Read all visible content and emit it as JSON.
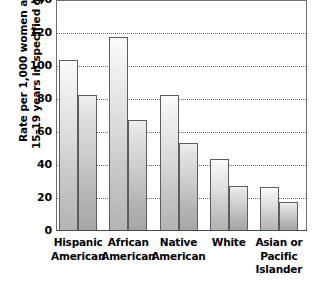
{
  "chart_data": {
    "type": "bar",
    "title": "",
    "subtitle": "",
    "xlabel": "",
    "ylabel_line1": "Rate per 1,000 women aged",
    "ylabel_line2": "15–19 years in specified group",
    "categories": [
      [
        "Hispanic",
        "American"
      ],
      [
        "African",
        "American"
      ],
      [
        "Native",
        "American"
      ],
      [
        "White"
      ],
      [
        "Asian or",
        "Pacific",
        "Islander"
      ]
    ],
    "series": [
      {
        "name": "series-1",
        "values": [
          103,
          117,
          82,
          43,
          26
        ]
      },
      {
        "name": "series-2",
        "values": [
          82,
          67,
          53,
          27,
          17
        ]
      }
    ],
    "ylim": [
      0,
      140
    ],
    "yticks": [
      0,
      20,
      40,
      60,
      80,
      100,
      120,
      140
    ],
    "ytick_labels": [
      "0",
      "20",
      "40",
      "60",
      "80",
      "100",
      "120",
      "140"
    ],
    "grid": true,
    "grid_style": "dotted",
    "legend": "none",
    "colors": {
      "bar_light": "#dcdcdc",
      "bar_dark": "#c6c6c6",
      "bar_border": "#5d5d5d",
      "gridline": "#6d6d6d",
      "axis": "#6f6f6f",
      "text": "#000000",
      "background": "#ffffff"
    }
  }
}
